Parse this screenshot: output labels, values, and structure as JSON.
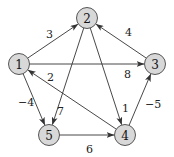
{
  "graph": {
    "directed": true,
    "node_color": "#d8d8d8",
    "edge_color": "#333333",
    "nodes": [
      {
        "id": "1",
        "label": "1",
        "x": 19,
        "y": 64
      },
      {
        "id": "2",
        "label": "2",
        "x": 87,
        "y": 18
      },
      {
        "id": "3",
        "label": "3",
        "x": 155,
        "y": 64
      },
      {
        "id": "4",
        "label": "4",
        "x": 125,
        "y": 135
      },
      {
        "id": "5",
        "label": "5",
        "x": 49,
        "y": 135
      }
    ],
    "edges": [
      {
        "from": "1",
        "to": "2",
        "weight": "3",
        "lx": 46,
        "ly": 38
      },
      {
        "from": "1",
        "to": "3",
        "weight": "8",
        "lx": 124,
        "ly": 78
      },
      {
        "from": "1",
        "to": "5",
        "weight": "−4",
        "lx": 18,
        "ly": 106
      },
      {
        "from": "2",
        "to": "5",
        "weight": "7",
        "lx": 57,
        "ly": 115
      },
      {
        "from": "2",
        "to": "4",
        "weight": "1",
        "lx": 122,
        "ly": 112
      },
      {
        "from": "3",
        "to": "2",
        "weight": "4",
        "lx": 125,
        "ly": 36
      },
      {
        "from": "4",
        "to": "3",
        "weight": "−5",
        "lx": 145,
        "ly": 108
      },
      {
        "from": "4",
        "to": "1",
        "weight": "2",
        "lx": 47,
        "ly": 81
      },
      {
        "from": "5",
        "to": "4",
        "weight": "6",
        "lx": 86,
        "ly": 153
      }
    ]
  }
}
